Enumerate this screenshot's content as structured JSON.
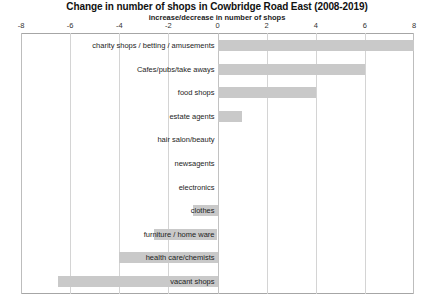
{
  "chart_data": {
    "type": "bar",
    "orientation": "horizontal",
    "title": "Change in number of shops in Cowbridge Road East (2008-2019)",
    "subtitle": "increase/decrease in number of shops",
    "xlabel": "",
    "ylabel": "",
    "xlim": [
      -8,
      8
    ],
    "xticks": [
      -8,
      -6,
      -4,
      -2,
      0,
      2,
      4,
      6,
      8
    ],
    "xtick_labels": [
      "-8",
      "-6",
      "-4",
      "-2",
      "0",
      "2",
      "4",
      "6",
      "8"
    ],
    "grid": true,
    "legend": false,
    "bar_color": "#c9c9c9",
    "categories": [
      "charity shops / betting / amusements",
      "Cafes/pubs/take aways",
      "food shops",
      "estate agents",
      "hair salon/beauty",
      "newsagents",
      "electronics",
      "clothes",
      "furniture / home ware",
      "health care/chemists",
      "vacant shops"
    ],
    "values": [
      8,
      6,
      4,
      1,
      0,
      0,
      0,
      -1,
      -2.6,
      -4,
      -6.5
    ]
  }
}
